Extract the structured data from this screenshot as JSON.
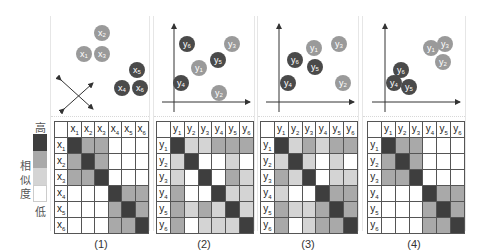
{
  "legend": {
    "high_label": "高",
    "low_label": "低",
    "title_chars": [
      "相",
      "似",
      "度"
    ],
    "levels": [
      "#3e3e3e",
      "#a9a9a9",
      "#d4d4d4",
      "#ffffff"
    ]
  },
  "colors": {
    "dark_point": "#4a4a4a",
    "light_point": "#9a9a9a",
    "axis": "#333333"
  },
  "panels": [
    {
      "caption": "(1)",
      "var": "x",
      "axes": false,
      "points": [
        {
          "label": "x",
          "sub": "2",
          "tone": "light"
        },
        {
          "label": "x",
          "sub": "1",
          "tone": "light"
        },
        {
          "label": "x",
          "sub": "3",
          "tone": "light"
        },
        {
          "label": "x",
          "sub": "5",
          "tone": "dark"
        },
        {
          "label": "x",
          "sub": "4",
          "tone": "dark"
        },
        {
          "label": "x",
          "sub": "6",
          "tone": "dark"
        }
      ],
      "headers": [
        "x1",
        "x2",
        "x3",
        "x4",
        "x5",
        "x6"
      ],
      "matrix": [
        [
          3,
          2,
          2,
          0,
          0,
          0
        ],
        [
          2,
          3,
          2,
          0,
          0,
          0
        ],
        [
          2,
          2,
          3,
          0,
          0,
          0
        ],
        [
          0,
          0,
          0,
          3,
          2,
          2
        ],
        [
          0,
          0,
          0,
          2,
          3,
          2
        ],
        [
          0,
          0,
          0,
          2,
          2,
          3
        ]
      ]
    },
    {
      "caption": "(2)",
      "var": "y",
      "axes": true,
      "points": [
        {
          "label": "y",
          "sub": "6",
          "tone": "dark"
        },
        {
          "label": "y",
          "sub": "3",
          "tone": "light"
        },
        {
          "label": "y",
          "sub": "5",
          "tone": "dark"
        },
        {
          "label": "y",
          "sub": "1",
          "tone": "light"
        },
        {
          "label": "y",
          "sub": "4",
          "tone": "dark"
        },
        {
          "label": "y",
          "sub": "2",
          "tone": "light"
        }
      ],
      "headers": [
        "y1",
        "y2",
        "y3",
        "y4",
        "y5",
        "y6"
      ],
      "matrix": [
        [
          3,
          1,
          1,
          2,
          2,
          2
        ],
        [
          1,
          3,
          0,
          0,
          1,
          0
        ],
        [
          1,
          0,
          3,
          0,
          2,
          1
        ],
        [
          2,
          0,
          0,
          3,
          1,
          1
        ],
        [
          2,
          1,
          2,
          1,
          3,
          1
        ],
        [
          2,
          0,
          1,
          1,
          1,
          3
        ]
      ]
    },
    {
      "caption": "(3)",
      "var": "y",
      "axes": true,
      "points": [
        {
          "label": "y",
          "sub": "1",
          "tone": "light"
        },
        {
          "label": "y",
          "sub": "3",
          "tone": "light"
        },
        {
          "label": "y",
          "sub": "6",
          "tone": "dark"
        },
        {
          "label": "y",
          "sub": "5",
          "tone": "dark"
        },
        {
          "label": "y",
          "sub": "4",
          "tone": "dark"
        },
        {
          "label": "y",
          "sub": "2",
          "tone": "light"
        }
      ],
      "headers": [
        "y1",
        "y2",
        "y3",
        "y4",
        "y5",
        "y6"
      ],
      "matrix": [
        [
          3,
          1,
          2,
          1,
          2,
          2
        ],
        [
          1,
          3,
          1,
          0,
          1,
          0
        ],
        [
          2,
          1,
          3,
          0,
          1,
          1
        ],
        [
          1,
          0,
          0,
          3,
          2,
          2
        ],
        [
          2,
          1,
          1,
          2,
          3,
          2
        ],
        [
          2,
          0,
          1,
          2,
          2,
          3
        ]
      ]
    },
    {
      "caption": "(4)",
      "var": "y",
      "axes": true,
      "points": [
        {
          "label": "y",
          "sub": "1",
          "tone": "light"
        },
        {
          "label": "y",
          "sub": "3",
          "tone": "light"
        },
        {
          "label": "y",
          "sub": "2",
          "tone": "light"
        },
        {
          "label": "y",
          "sub": "6",
          "tone": "dark"
        },
        {
          "label": "y",
          "sub": "4",
          "tone": "dark"
        },
        {
          "label": "y",
          "sub": "5",
          "tone": "dark"
        }
      ],
      "headers": [
        "y1",
        "y2",
        "y3",
        "y4",
        "y5",
        "y6"
      ],
      "matrix": [
        [
          3,
          2,
          2,
          0,
          0,
          0
        ],
        [
          2,
          3,
          2,
          0,
          0,
          0
        ],
        [
          2,
          2,
          3,
          0,
          0,
          0
        ],
        [
          0,
          0,
          0,
          3,
          2,
          2
        ],
        [
          0,
          0,
          0,
          2,
          3,
          2
        ],
        [
          0,
          0,
          0,
          2,
          2,
          3
        ]
      ]
    }
  ]
}
